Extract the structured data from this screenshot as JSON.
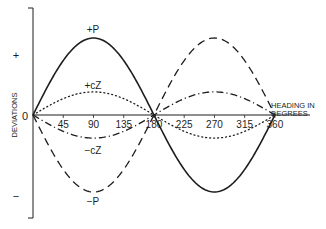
{
  "chart_data": {
    "type": "line",
    "title": "",
    "xlabel": "HEADING IN DEGREES",
    "xlabel_lines": [
      "HEADING IN",
      "DEGREES"
    ],
    "ylabel": "DEVIATIONS",
    "y_sign_labels": {
      "plus": "+",
      "zero": "0",
      "minus": "−"
    },
    "x_ticks": [
      45,
      90,
      135,
      180,
      225,
      270,
      315,
      360
    ],
    "x_tick_labels": [
      "45",
      "90",
      "135",
      "180",
      "225",
      "270",
      "315",
      "360"
    ],
    "xlim": [
      0,
      360
    ],
    "ylim": [
      -1.35,
      1.35
    ],
    "grid": false,
    "legend": "inline annotations",
    "series": [
      {
        "name": "+P",
        "formula": "P sin(heading)",
        "amplitude": 1.0,
        "sign": 1,
        "style": "solid",
        "label": "+P",
        "label_at": 90
      },
      {
        "name": "-P",
        "formula": "-P sin(heading)",
        "amplitude": 1.0,
        "sign": -1,
        "style": "dashed",
        "label": "−P",
        "label_at": 90
      },
      {
        "name": "+cZ",
        "formula": "cZ sin(heading)",
        "amplitude": 0.3,
        "sign": 1,
        "style": "dotted",
        "label": "+cZ",
        "label_at": 90
      },
      {
        "name": "-cZ",
        "formula": "-cZ sin(heading)",
        "amplitude": 0.3,
        "sign": -1,
        "style": "dashdot",
        "label": "−cZ",
        "label_at": 90
      }
    ],
    "annotations": [
      "+P",
      "−P",
      "+cZ",
      "−cZ"
    ]
  },
  "layout": {
    "origin_x": 33,
    "zero_y": 115,
    "px_per_degree": 0.672,
    "px_per_unit": 77,
    "axis_top_y": 8,
    "axis_bottom_y": 218,
    "baseline_end_x": 310,
    "ink": "#1e1e1e"
  }
}
